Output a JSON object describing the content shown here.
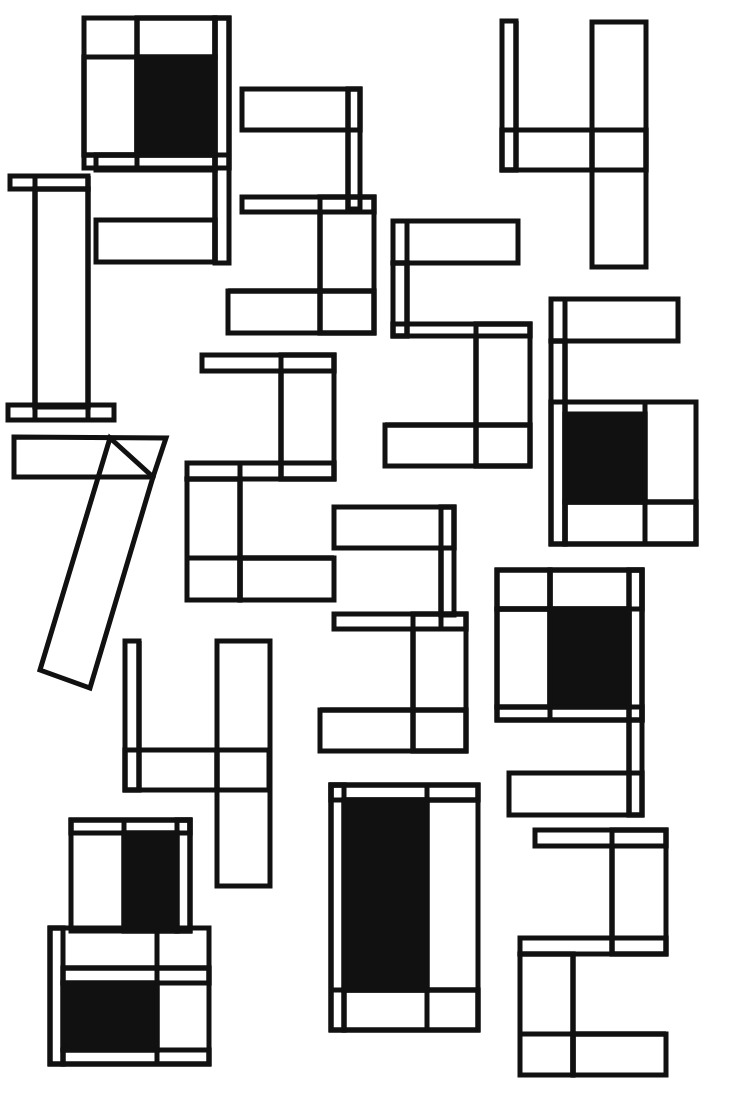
{
  "artwork": {
    "description": "Geometric digits composed of outlined rectangles with black filled blocks",
    "stroke_color": "#111111",
    "fill_color": "#111111",
    "background": "#ffffff",
    "digits": [
      {
        "label": "9",
        "rects": [
          [
            84,
            18,
            145,
            150
          ],
          [
            84,
            57,
            53,
            98
          ],
          [
            137,
            18,
            78,
            39
          ],
          [
            215,
            18,
            14,
            245
          ],
          [
            96,
            155,
            119,
            15
          ],
          [
            96,
            220,
            119,
            42
          ]
        ],
        "fills": [
          [
            137,
            57,
            78,
            98
          ]
        ]
      },
      {
        "label": "3",
        "rects": [
          [
            242,
            89,
            118,
            41
          ],
          [
            348,
            89,
            12,
            120
          ],
          [
            242,
            197,
            132,
            15
          ],
          [
            320,
            197,
            54,
            136
          ],
          [
            228,
            291,
            146,
            42
          ]
        ],
        "fills": []
      },
      {
        "label": "1",
        "rects": [
          [
            10,
            176,
            78,
            13
          ],
          [
            35,
            189,
            53,
            218
          ],
          [
            8,
            405,
            106,
            15
          ]
        ],
        "fills": []
      },
      {
        "label": "4",
        "rects": [
          [
            502,
            21,
            14,
            149
          ],
          [
            502,
            130,
            144,
            40
          ],
          [
            592,
            22,
            54,
            245
          ]
        ],
        "fills": []
      },
      {
        "label": "5",
        "rects": [
          [
            393,
            221,
            125,
            42
          ],
          [
            393,
            263,
            14,
            73
          ],
          [
            393,
            324,
            137,
            12
          ],
          [
            476,
            324,
            54,
            142
          ],
          [
            385,
            425,
            145,
            41
          ]
        ],
        "fills": []
      },
      {
        "label": "6",
        "rects": [
          [
            551,
            299,
            127,
            42
          ],
          [
            551,
            341,
            14,
            203
          ],
          [
            551,
            402,
            145,
            142
          ],
          [
            565,
            502,
            131,
            42
          ]
        ],
        "fills": [
          [
            565,
            414,
            80,
            88
          ]
        ]
      },
      {
        "label": "7",
        "polys": [
          [
            [
              14,
              437
            ],
            [
              166,
              438
            ],
            [
              153,
              477
            ],
            [
              14,
              477
            ]
          ],
          [
            [
              110,
              438
            ],
            [
              153,
              477
            ],
            [
              90,
              688
            ],
            [
              40,
              670
            ]
          ]
        ],
        "rects": [],
        "fills": []
      },
      {
        "label": "2",
        "rects": [
          [
            202,
            355,
            132,
            16
          ],
          [
            281,
            355,
            53,
            124
          ],
          [
            187,
            463,
            147,
            16
          ],
          [
            187,
            479,
            53,
            121
          ],
          [
            240,
            558,
            94,
            42
          ]
        ],
        "fills": []
      },
      {
        "label": "3",
        "rects": [
          [
            334,
            507,
            120,
            41
          ],
          [
            441,
            507,
            13,
            108
          ],
          [
            334,
            614,
            132,
            15
          ],
          [
            413,
            614,
            53,
            137
          ],
          [
            320,
            710,
            146,
            41
          ]
        ],
        "fills": []
      },
      {
        "label": "9",
        "rects": [
          [
            497,
            570,
            145,
            150
          ],
          [
            497,
            570,
            53,
            39
          ],
          [
            550,
            570,
            92,
            39
          ],
          [
            497,
            609,
            53,
            98
          ],
          [
            497,
            707,
            145,
            13
          ],
          [
            629,
            570,
            13,
            245
          ],
          [
            509,
            773,
            133,
            42
          ]
        ],
        "fills": [
          [
            550,
            609,
            79,
            98
          ]
        ]
      },
      {
        "label": "4",
        "rects": [
          [
            125,
            641,
            14,
            149
          ],
          [
            125,
            750,
            144,
            40
          ],
          [
            217,
            641,
            53,
            245
          ]
        ],
        "fills": []
      },
      {
        "label": "8",
        "rects": [
          [
            71,
            820,
            119,
            111
          ],
          [
            71,
            820,
            119,
            13
          ],
          [
            177,
            820,
            13,
            111
          ],
          [
            50,
            928,
            159,
            136
          ],
          [
            50,
            928,
            13,
            136
          ],
          [
            63,
            968,
            146,
            15
          ],
          [
            63,
            1050,
            146,
            14
          ]
        ],
        "fills": [
          [
            124,
            833,
            53,
            98
          ],
          [
            63,
            983,
            94,
            67
          ]
        ]
      },
      {
        "label": "0",
        "rects": [
          [
            331,
            785,
            147,
            245
          ],
          [
            331,
            785,
            147,
            15
          ],
          [
            331,
            785,
            13,
            245
          ],
          [
            344,
            990,
            134,
            40
          ]
        ],
        "fills": [
          [
            344,
            800,
            83,
            190
          ]
        ]
      },
      {
        "label": "2",
        "rects": [
          [
            535,
            830,
            131,
            16
          ],
          [
            612,
            830,
            54,
            124
          ],
          [
            520,
            938,
            146,
            16
          ],
          [
            520,
            954,
            53,
            121
          ],
          [
            573,
            1034,
            93,
            41
          ]
        ],
        "fills": []
      }
    ],
    "divider_lines": [
      [
        137,
        18,
        137,
        168
      ],
      [
        84,
        155,
        229,
        155
      ],
      [
        215,
        18,
        215,
        263
      ],
      [
        348,
        89,
        348,
        212
      ],
      [
        320,
        212,
        320,
        333
      ],
      [
        228,
        291,
        374,
        291
      ],
      [
        35,
        176,
        35,
        420
      ],
      [
        88,
        176,
        88,
        420
      ],
      [
        516,
        21,
        516,
        170
      ],
      [
        592,
        130,
        592,
        170
      ],
      [
        407,
        221,
        407,
        336
      ],
      [
        476,
        336,
        476,
        466
      ],
      [
        385,
        425,
        530,
        425
      ],
      [
        565,
        299,
        565,
        544
      ],
      [
        645,
        402,
        645,
        544
      ],
      [
        565,
        502,
        696,
        502
      ],
      [
        281,
        371,
        281,
        479
      ],
      [
        240,
        463,
        240,
        600
      ],
      [
        187,
        558,
        334,
        558
      ],
      [
        441,
        548,
        441,
        629
      ],
      [
        413,
        629,
        413,
        751
      ],
      [
        320,
        710,
        466,
        710
      ],
      [
        550,
        570,
        550,
        720
      ],
      [
        497,
        609,
        629,
        609
      ],
      [
        629,
        570,
        629,
        815
      ],
      [
        139,
        641,
        139,
        790
      ],
      [
        217,
        750,
        217,
        790
      ],
      [
        124,
        820,
        124,
        931
      ],
      [
        157,
        928,
        157,
        1064
      ],
      [
        63,
        968,
        209,
        968
      ],
      [
        427,
        785,
        427,
        1030
      ],
      [
        344,
        800,
        478,
        800
      ],
      [
        331,
        990,
        478,
        990
      ],
      [
        612,
        846,
        612,
        954
      ],
      [
        573,
        954,
        573,
        1075
      ],
      [
        520,
        1034,
        666,
        1034
      ]
    ]
  }
}
